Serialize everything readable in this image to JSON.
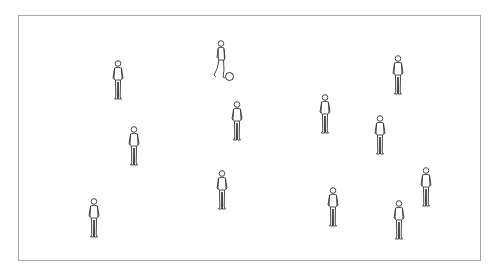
{
  "diagram": {
    "type": "soccer-drill",
    "field": {
      "shape": "rectangle",
      "border_color": "#a8a8a8"
    },
    "players": [
      {
        "id": 1,
        "pose": "standing",
        "x": 118,
        "y": 60
      },
      {
        "id": 2,
        "pose": "dribbling",
        "x": 220,
        "y": 40,
        "has_ball": true
      },
      {
        "id": 3,
        "pose": "standing",
        "x": 398,
        "y": 55
      },
      {
        "id": 4,
        "pose": "standing",
        "x": 325,
        "y": 94
      },
      {
        "id": 5,
        "pose": "standing",
        "x": 237,
        "y": 101
      },
      {
        "id": 6,
        "pose": "standing",
        "x": 134,
        "y": 126
      },
      {
        "id": 7,
        "pose": "standing",
        "x": 380,
        "y": 115
      },
      {
        "id": 8,
        "pose": "standing",
        "x": 222,
        "y": 170
      },
      {
        "id": 9,
        "pose": "standing",
        "x": 426,
        "y": 167
      },
      {
        "id": 10,
        "pose": "standing",
        "x": 94,
        "y": 198
      },
      {
        "id": 11,
        "pose": "standing",
        "x": 333,
        "y": 187
      },
      {
        "id": 12,
        "pose": "standing",
        "x": 399,
        "y": 200
      }
    ],
    "ball": {
      "x": 229,
      "y": 76
    },
    "line_color": "#333333"
  }
}
